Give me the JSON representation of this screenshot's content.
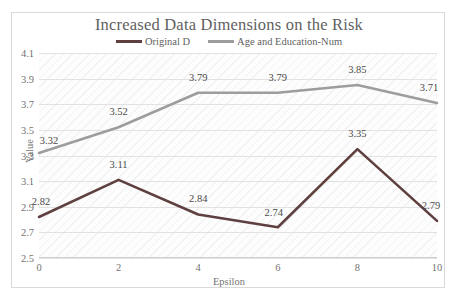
{
  "chart_data": {
    "type": "line",
    "title": "Increased Data Dimensions on the Risk",
    "xlabel": "Epsilon",
    "ylabel": "Value",
    "x": [
      0,
      2,
      4,
      6,
      8,
      10
    ],
    "xticklabels": [
      "0",
      "2",
      "4",
      "6",
      "8",
      "10"
    ],
    "xlim": [
      0,
      10
    ],
    "ylim": [
      2.5,
      4.1
    ],
    "yticks": [
      2.5,
      2.7,
      2.9,
      3.1,
      3.3,
      3.5,
      3.7,
      3.9,
      4.1
    ],
    "yticklabels": [
      "2.5",
      "2.7",
      "2.9",
      "3.1",
      "3.3",
      "3.5",
      "3.7",
      "3.9",
      "4.1"
    ],
    "grid": "horizontal",
    "legend_position": "top-center",
    "data_labels": true,
    "series": [
      {
        "name": "Original D",
        "color": "#5e4040",
        "values": [
          2.82,
          3.11,
          2.84,
          2.74,
          3.35,
          2.79
        ],
        "labels": [
          "2.82",
          "3.11",
          "2.84",
          "2.74",
          "3.35",
          "2.79"
        ],
        "label_offsets": [
          {
            "dx": 2,
            "dy": -10
          },
          {
            "dx": 0,
            "dy": -10
          },
          {
            "dx": 0,
            "dy": -10
          },
          {
            "dx": -4,
            "dy": -9
          },
          {
            "dx": 0,
            "dy": -10
          },
          {
            "dx": -6,
            "dy": -10
          }
        ]
      },
      {
        "name": "Age and Education-Num",
        "color": "#9d9d9d",
        "values": [
          3.32,
          3.52,
          3.79,
          3.79,
          3.85,
          3.71
        ],
        "labels": [
          "3.32",
          "3.52",
          "3.79",
          "3.79",
          "3.85",
          "3.71"
        ],
        "label_offsets": [
          {
            "dx": 10,
            "dy": -7
          },
          {
            "dx": 0,
            "dy": -10
          },
          {
            "dx": 0,
            "dy": -10
          },
          {
            "dx": 0,
            "dy": -10
          },
          {
            "dx": 0,
            "dy": -10
          },
          {
            "dx": -8,
            "dy": -10
          }
        ]
      }
    ]
  }
}
